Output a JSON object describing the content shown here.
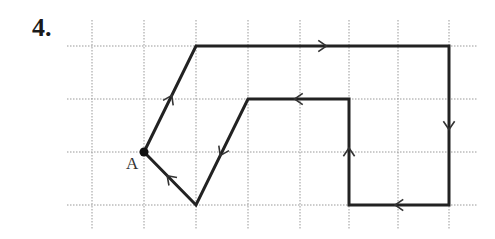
{
  "problem": {
    "number": "4."
  },
  "grid": {
    "x_lines": [
      92,
      144,
      196,
      248,
      300,
      349,
      398,
      449
    ],
    "y_lines": [
      46,
      99,
      152,
      205
    ],
    "x_extent": [
      67,
      477
    ],
    "y_extent": [
      20,
      230
    ],
    "style": "dotted",
    "color": "#999999"
  },
  "path": {
    "color": "#222222",
    "stroke_width": 3,
    "vertices": [
      {
        "x": 144,
        "y": 152,
        "label": "A"
      },
      {
        "x": 196,
        "y": 46
      },
      {
        "x": 449,
        "y": 46
      },
      {
        "x": 449,
        "y": 205
      },
      {
        "x": 349,
        "y": 205
      },
      {
        "x": 349,
        "y": 99
      },
      {
        "x": 248,
        "y": 99
      },
      {
        "x": 196,
        "y": 205
      }
    ],
    "closed": true,
    "arrows": [
      {
        "segment": 0,
        "direction": "up-right"
      },
      {
        "segment": 1,
        "direction": "right"
      },
      {
        "segment": 2,
        "direction": "down"
      },
      {
        "segment": 3,
        "direction": "left"
      },
      {
        "segment": 4,
        "direction": "up"
      },
      {
        "segment": 5,
        "direction": "left"
      },
      {
        "segment": 6,
        "direction": "down-left"
      },
      {
        "segment": 7,
        "direction": "up-left"
      }
    ]
  },
  "start_point": {
    "label": "A",
    "x": 144,
    "y": 152
  }
}
